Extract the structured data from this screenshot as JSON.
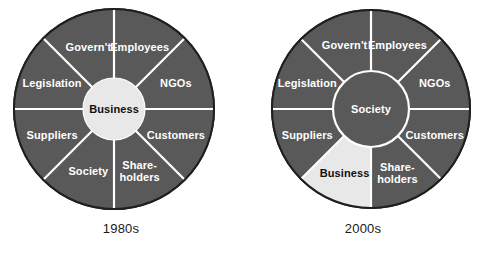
{
  "figure": {
    "background_color": "#ffffff",
    "ring_color": "#595959",
    "highlight_color": "#e8e8e8",
    "divider_color": "#ffffff",
    "outline_color": "#1f1f1f",
    "label_text_color": "#ffffff",
    "dark_text_color": "#111111"
  },
  "chart_data": {
    "type": "pie",
    "title": "",
    "charts": [
      {
        "caption": "1980s",
        "hub": {
          "label": "Business",
          "fill": "light",
          "text_color": "#111111"
        },
        "segment_count": 8,
        "segment_angle_deg": 45,
        "categories": [
          "Employees",
          "NGOs",
          "Customers",
          "Share-holders",
          "Society",
          "Suppliers",
          "Legislation",
          "Govern't"
        ],
        "values": [
          45,
          45,
          45,
          45,
          45,
          45,
          45,
          45
        ],
        "segments": [
          {
            "label": "Employees",
            "label_lines": [
              "Employees"
            ],
            "start_deg": -90,
            "end_deg": -45,
            "fill": "dark"
          },
          {
            "label": "NGOs",
            "label_lines": [
              "NGOs"
            ],
            "start_deg": -45,
            "end_deg": 0,
            "fill": "dark"
          },
          {
            "label": "Customers",
            "label_lines": [
              "Customers"
            ],
            "start_deg": 0,
            "end_deg": 45,
            "fill": "dark"
          },
          {
            "label": "Shareholders",
            "label_lines": [
              "Share-",
              "holders"
            ],
            "start_deg": 45,
            "end_deg": 90,
            "fill": "dark"
          },
          {
            "label": "Society",
            "label_lines": [
              "Society"
            ],
            "start_deg": 90,
            "end_deg": 135,
            "fill": "dark"
          },
          {
            "label": "Suppliers",
            "label_lines": [
              "Suppliers"
            ],
            "start_deg": 135,
            "end_deg": 180,
            "fill": "dark"
          },
          {
            "label": "Legislation",
            "label_lines": [
              "Legislation"
            ],
            "start_deg": 180,
            "end_deg": 225,
            "fill": "dark"
          },
          {
            "label": "Govern't",
            "label_lines": [
              "Govern't"
            ],
            "start_deg": 225,
            "end_deg": 270,
            "fill": "dark"
          }
        ]
      },
      {
        "caption": "2000s",
        "hub": {
          "label": "Society",
          "fill": "dark",
          "text_color": "#ffffff"
        },
        "segment_count": 8,
        "segment_angle_deg": 45,
        "categories": [
          "Employees",
          "NGOs",
          "Customers",
          "Share-holders",
          "Business",
          "Suppliers",
          "Legislation",
          "Govern't"
        ],
        "values": [
          45,
          45,
          45,
          45,
          45,
          45,
          45,
          45
        ],
        "segments": [
          {
            "label": "Employees",
            "label_lines": [
              "Employees"
            ],
            "start_deg": -90,
            "end_deg": -45,
            "fill": "dark"
          },
          {
            "label": "NGOs",
            "label_lines": [
              "NGOs"
            ],
            "start_deg": -45,
            "end_deg": 0,
            "fill": "dark"
          },
          {
            "label": "Customers",
            "label_lines": [
              "Customers"
            ],
            "start_deg": 0,
            "end_deg": 45,
            "fill": "dark"
          },
          {
            "label": "Shareholders",
            "label_lines": [
              "Share-",
              "holders"
            ],
            "start_deg": 45,
            "end_deg": 90,
            "fill": "dark"
          },
          {
            "label": "Business",
            "label_lines": [
              "Business"
            ],
            "start_deg": 90,
            "end_deg": 135,
            "fill": "light"
          },
          {
            "label": "Suppliers",
            "label_lines": [
              "Suppliers"
            ],
            "start_deg": 135,
            "end_deg": 180,
            "fill": "dark"
          },
          {
            "label": "Legislation",
            "label_lines": [
              "Legislation"
            ],
            "start_deg": 180,
            "end_deg": 225,
            "fill": "dark"
          },
          {
            "label": "Govern't",
            "label_lines": [
              "Govern't"
            ],
            "start_deg": 225,
            "end_deg": 270,
            "fill": "dark"
          }
        ]
      }
    ]
  },
  "panels": [
    {
      "caption": "1980s"
    },
    {
      "caption": "2000s"
    }
  ]
}
